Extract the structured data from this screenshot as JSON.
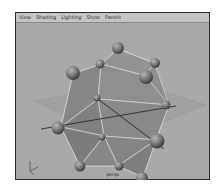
{
  "menubar": {
    "items": [
      {
        "label": "View"
      },
      {
        "label": "Shading"
      },
      {
        "label": "Lighting"
      },
      {
        "label": "Show"
      },
      {
        "label": "Panels"
      }
    ]
  },
  "viewport": {
    "camera_label": "persp",
    "axis_labels": {
      "y": "y",
      "z": "z",
      "x": "x"
    },
    "colors": {
      "background": "#a9a9a9",
      "grid": "#9c9c9c",
      "faces": "#8a8a8a",
      "edges": "#e6e6e6",
      "spheres": "#7a7a7a",
      "axis_line": "#2a2a2a"
    }
  }
}
